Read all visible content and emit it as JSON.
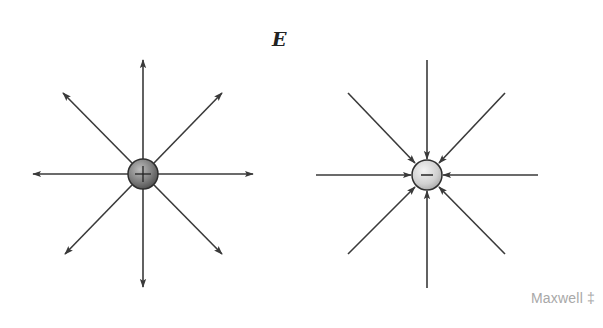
{
  "title": "E",
  "watermark": "Maxwell ‡",
  "colors": {
    "line": "#3a3a3a",
    "positive_charge": "#8a8a8a",
    "negative_charge": "#d8d8d8",
    "watermark": "#a8a8a8"
  },
  "charges": [
    {
      "sign": "+",
      "label": "positive-charge",
      "cx": 143,
      "cy": 174,
      "r": 15,
      "field_direction": "outward"
    },
    {
      "sign": "−",
      "label": "negative-charge",
      "cx": 427,
      "cy": 175,
      "r": 15,
      "field_direction": "inward"
    }
  ]
}
